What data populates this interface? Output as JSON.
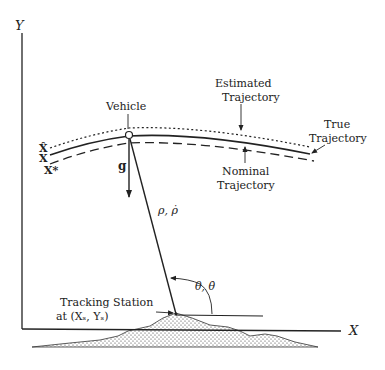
{
  "figure": {
    "type": "orbit-determination-geometry",
    "axes": {
      "y_label": "Y",
      "x_label": "X"
    },
    "vehicle_label": "Vehicle",
    "estimated_trajectory": {
      "line1": "Estimated",
      "line2": "Trajectory"
    },
    "true_trajectory": {
      "line1": "True",
      "line2": "Trajectory"
    },
    "nominal_trajectory": {
      "line1": "Nominal",
      "line2": "Trajectory"
    },
    "state_labels": {
      "estimated": "X̂",
      "true": "X",
      "nominal": "X*"
    },
    "gravity_label": "g",
    "range_label": "ρ, ρ̇",
    "angle_label": "θ, θ̇",
    "station": {
      "line1": "Tracking Station",
      "line2": "at (Xₛ, Yₛ)"
    }
  }
}
